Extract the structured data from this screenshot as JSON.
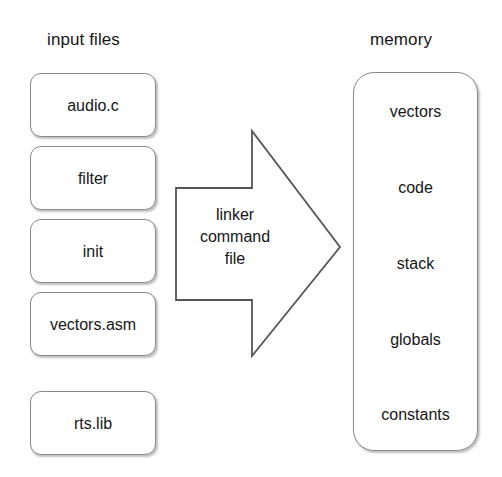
{
  "diagram": {
    "background_color": "#ffffff",
    "line_color": "#8a8a8a",
    "arrow_color": "#555555",
    "text_color": "#161616"
  },
  "input_column": {
    "heading": "input files",
    "files": [
      {
        "label": "audio.c"
      },
      {
        "label": "filter"
      },
      {
        "label": "init"
      },
      {
        "label": "vectors.asm"
      },
      {
        "label": "rts.lib"
      }
    ]
  },
  "arrow": {
    "name": "linker-command-file-arrow",
    "direction": "right",
    "label_lines": [
      "linker",
      "command",
      "file"
    ]
  },
  "memory_column": {
    "heading": "memory",
    "sections": [
      {
        "label": "vectors"
      },
      {
        "label": "code"
      },
      {
        "label": "stack"
      },
      {
        "label": "globals"
      },
      {
        "label": "constants"
      }
    ]
  }
}
